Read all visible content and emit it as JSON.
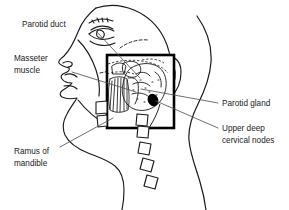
{
  "figure": {
    "background_color": "#ffffff",
    "ink_color": "#1a1a1a",
    "node_fill_color": "#000000",
    "width": 289,
    "height": 210
  },
  "labels": [
    {
      "id": "parotid-duct",
      "lines": [
        "Parotid duct"
      ],
      "text_x": 22,
      "text_y": 27,
      "anchor": "start",
      "leader": "M 96,31 L 140,78"
    },
    {
      "id": "masseter-muscle",
      "lines": [
        "Masseter",
        "muscle"
      ],
      "text_x": 14,
      "text_y": 61,
      "anchor": "start",
      "leader": "M 72,72 L 136,92"
    },
    {
      "id": "ramus-of-mandible",
      "lines": [
        "Ramus of",
        "mandible"
      ],
      "text_x": 14,
      "text_y": 154,
      "anchor": "start",
      "leader": "M 60,147 L 113,118"
    },
    {
      "id": "parotid-gland",
      "lines": [
        "Parotid gland"
      ],
      "text_x": 222,
      "text_y": 106,
      "anchor": "start",
      "leader": "M 218,103 L 141,89"
    },
    {
      "id": "upper-deep-cervical-nodes",
      "lines": [
        "Upper deep",
        "cervical nodes"
      ],
      "text_x": 222,
      "text_y": 131,
      "anchor": "start",
      "leader": "M 218,128 L 156,101"
    }
  ],
  "inset_box": {
    "x": 107,
    "y": 55,
    "width": 67,
    "height": 73,
    "stroke_width": 2.6
  },
  "lymph_node": {
    "cx": 153,
    "cy": 100,
    "rx": 5.2,
    "ry": 6.4,
    "rotation": -25
  },
  "vertebrae": [
    {
      "cx": 143,
      "cy": 131,
      "size": 11,
      "rotation": 8
    },
    {
      "cx": 146,
      "cy": 147,
      "size": 11,
      "rotation": 12
    },
    {
      "cx": 150,
      "cy": 163,
      "size": 11,
      "rotation": 16
    },
    {
      "cx": 155,
      "cy": 179,
      "size": 11,
      "rotation": 20
    }
  ]
}
